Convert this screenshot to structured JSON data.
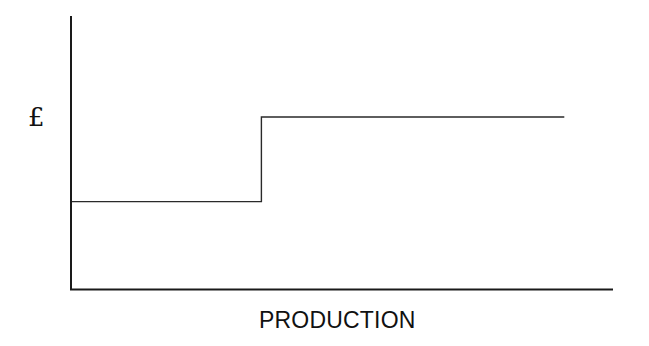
{
  "chart_data": {
    "type": "line",
    "subtype": "step",
    "title": "",
    "xlabel": "PRODUCTION",
    "ylabel": "£",
    "x_ticks": [],
    "y_ticks": [],
    "grid": false,
    "legend": null,
    "axis_ranges_note": "No numeric scale shown; values are relative positions (0-100) on each axis",
    "xlim": [
      0,
      100
    ],
    "ylim": [
      0,
      100
    ],
    "series": [
      {
        "name": "stepped cost",
        "points": [
          {
            "x": 0,
            "y": 32
          },
          {
            "x": 35,
            "y": 32
          },
          {
            "x": 35,
            "y": 63
          },
          {
            "x": 91,
            "y": 63
          }
        ]
      }
    ]
  },
  "labels": {
    "y_axis": "£",
    "x_axis": "PRODUCTION"
  },
  "style": {
    "line_color": "#2a2a2a",
    "axis_color": "#1a1a1a",
    "background": "#ffffff"
  }
}
